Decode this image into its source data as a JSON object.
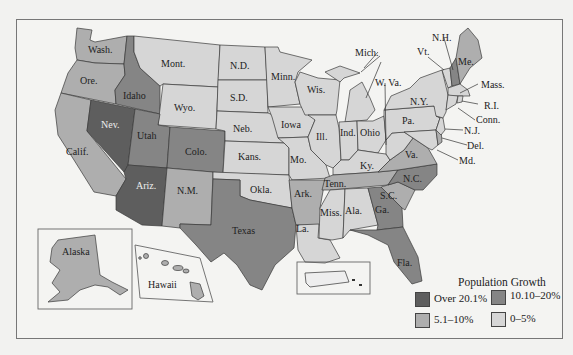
{
  "map": {
    "title": "Population Growth",
    "legend": [
      {
        "label": "Over 20.1%",
        "color": "#5e5e5e"
      },
      {
        "label": "10.10–20%",
        "color": "#858585"
      },
      {
        "label": "5.1–10%",
        "color": "#aeaeae"
      },
      {
        "label": "0–5%",
        "color": "#d6d6d6"
      }
    ],
    "states": {
      "wash": "Wash.",
      "ore": "Ore.",
      "calif": "Calif.",
      "idaho": "Idaho",
      "nev": "Nev.",
      "mont": "Mont.",
      "wyo": "Wyo.",
      "utah": "Utah",
      "colo": "Colo.",
      "ariz": "Ariz.",
      "nm": "N.M.",
      "nd": "N.D.",
      "sd": "S.D.",
      "neb": "Neb.",
      "kans": "Kans.",
      "okla": "Okla.",
      "texas": "Texas",
      "minn": "Minn.",
      "iowa": "Iowa",
      "mo": "Mo.",
      "ark": "Ark.",
      "la": "La.",
      "wis": "Wis.",
      "ill": "Ill.",
      "mich": "Mich.",
      "ind": "Ind.",
      "ohio": "Ohio",
      "ky": "Ky.",
      "tenn": "Tenn.",
      "miss": "Miss.",
      "ala": "Ala.",
      "ga": "Ga.",
      "fla": "Fla.",
      "sc": "S.C.",
      "nc": "N.C.",
      "va": "Va.",
      "wva": "W. Va.",
      "pa": "Pa.",
      "ny": "N.Y.",
      "vt": "Vt.",
      "nh": "N.H.",
      "me": "Me.",
      "mass": "Mass.",
      "ri": "R.I.",
      "conn": "Conn.",
      "nj": "N.J.",
      "del": "Del.",
      "md": "Md.",
      "alaska": "Alaska",
      "hawaii": "Hawaii"
    },
    "categories": {
      "over_20_1": [
        "Nev.",
        "Ariz."
      ],
      "10_10_to_20": [
        "Idaho",
        "Utah",
        "Colo.",
        "Texas",
        "N.C.",
        "Ga.",
        "Fla.",
        "N.H."
      ],
      "5_1_to_10": [
        "Wash.",
        "Ore.",
        "Calif.",
        "N.M.",
        "Ark.",
        "Tenn.",
        "S.C.",
        "Va.",
        "Alaska",
        "Hawaii",
        "Del.",
        "Me."
      ],
      "0_to_5": [
        "Mont.",
        "Wyo.",
        "N.D.",
        "S.D.",
        "Neb.",
        "Kans.",
        "Okla.",
        "Minn.",
        "Iowa",
        "Mo.",
        "La.",
        "Wis.",
        "Ill.",
        "Mich.",
        "Ind.",
        "Ohio",
        "Ky.",
        "Miss.",
        "Ala.",
        "W. Va.",
        "Pa.",
        "N.Y.",
        "Vt.",
        "Mass.",
        "R.I.",
        "Conn.",
        "N.J.",
        "Md."
      ]
    }
  }
}
